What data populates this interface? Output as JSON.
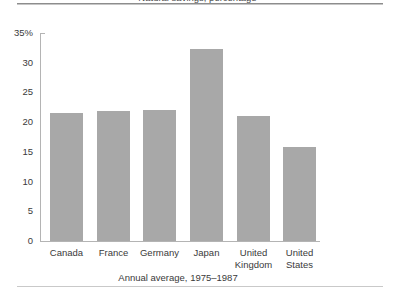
{
  "figure": {
    "title": "Natural savings, percentage",
    "caption": "Annual average, 1975–1987",
    "bar_color": "#a8a8a8",
    "axis_color": "#b4b4b4",
    "text_color": "#3a3a3a"
  },
  "chart_data": {
    "type": "bar",
    "title": "Natural savings, percentage",
    "xlabel": "Annual average, 1975–1987",
    "ylabel": "",
    "categories": [
      "Canada",
      "France",
      "Germany",
      "Japan",
      "United Kingdom",
      "United States"
    ],
    "category_lines": [
      [
        "Canada"
      ],
      [
        "France"
      ],
      [
        "Germany"
      ],
      [
        "Japan"
      ],
      [
        "United",
        "Kingdom"
      ],
      [
        "United",
        "States"
      ]
    ],
    "values": [
      21.5,
      21.8,
      22.0,
      32.3,
      21.0,
      15.8
    ],
    "ylim": [
      0,
      35
    ],
    "yticks": [
      0,
      5,
      10,
      15,
      20,
      25,
      30,
      35
    ],
    "ytick_labels": [
      "0",
      "5",
      "10",
      "15",
      "20",
      "25",
      "30",
      "35%"
    ],
    "grid": false,
    "legend": false
  }
}
